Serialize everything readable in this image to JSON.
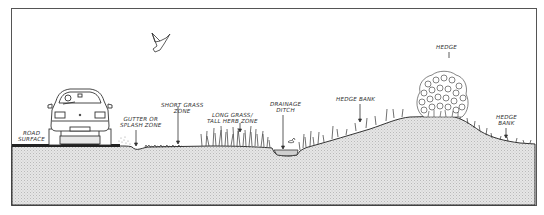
{
  "colors": {
    "frame": "#555555",
    "ground_fill": "#e4e4e4",
    "ground_dots": "#bdbdbd",
    "line": "#333333",
    "road": "#222222"
  },
  "labels": {
    "road_surface": [
      "ROAD",
      "SURFACE"
    ],
    "gutter": [
      "GUTTER OR",
      "SPLASH ZONE"
    ],
    "short_grass": [
      "SHORT GRASS",
      "ZONE"
    ],
    "long_grass": [
      "LONG GRASS/",
      "TALL HERB ZONE"
    ],
    "drainage_ditch": [
      "DRAINAGE",
      "DITCH"
    ],
    "hedge_bank_1": [
      "HEDGE  BANK"
    ],
    "hedge": [
      "HEDGE"
    ],
    "hedge_bank_2": [
      "HEDGE",
      "BANK"
    ]
  },
  "illustrations": {
    "car": "car-front-view",
    "bird": "bird-in-flight",
    "hedge": "hedge-shrub"
  }
}
